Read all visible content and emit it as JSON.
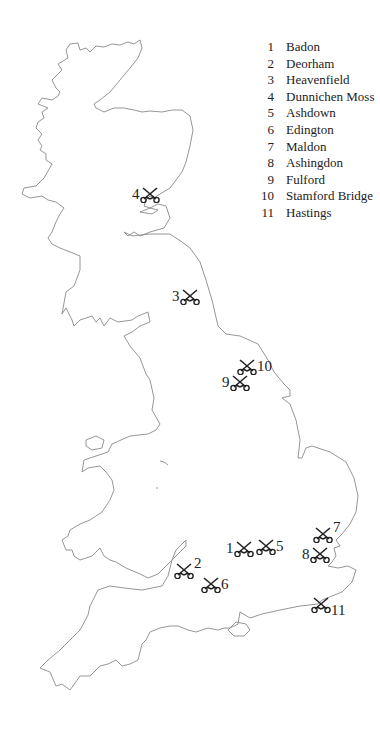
{
  "legend": {
    "items": [
      {
        "number": "1",
        "name": "Badon"
      },
      {
        "number": "2",
        "name": "Deorham"
      },
      {
        "number": "3",
        "name": "Heavenfield"
      },
      {
        "number": "4",
        "name": "Dunnichen Moss"
      },
      {
        "number": "5",
        "name": "Ashdown"
      },
      {
        "number": "6",
        "name": "Edington"
      },
      {
        "number": "7",
        "name": "Maldon"
      },
      {
        "number": "8",
        "name": "Ashingdon"
      },
      {
        "number": "9",
        "name": "Fulford"
      },
      {
        "number": "10",
        "name": "Stamford Bridge"
      },
      {
        "number": "11",
        "name": "Hastings"
      }
    ]
  },
  "markers": [
    {
      "label": "1",
      "name": "Badon"
    },
    {
      "label": "2",
      "name": "Deorham"
    },
    {
      "label": "3",
      "name": "Heavenfield"
    },
    {
      "label": "4",
      "name": "Dunnichen Moss"
    },
    {
      "label": "5",
      "name": "Ashdown"
    },
    {
      "label": "6",
      "name": "Edington"
    },
    {
      "label": "7",
      "name": "Maldon"
    },
    {
      "label": "8",
      "name": "Ashingdon"
    },
    {
      "label": "9",
      "name": "Fulford"
    },
    {
      "label": "10",
      "name": "Stamford Bridge"
    },
    {
      "label": "11",
      "name": "Hastings"
    }
  ],
  "icons": {
    "battle": "crossed-swords-icon"
  },
  "colors": {
    "coastline": "#8a8a8a",
    "text": "#222222",
    "background": "#ffffff"
  }
}
